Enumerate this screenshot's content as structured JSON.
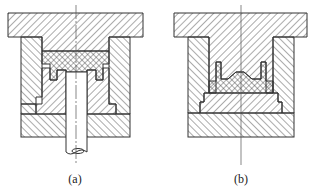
{
  "figure": {
    "type": "mold cross-section diagram",
    "panels": [
      {
        "id": "a",
        "label": "(a)",
        "description": "Mold with lower plunger rod pushing material upward into upper cavity"
      },
      {
        "id": "b",
        "label": "(b)",
        "description": "Mold with compacted material on lower punch, no plunger rod"
      }
    ],
    "colors": {
      "line": "#333333",
      "hatch": "#555555",
      "background": "#ffffff"
    },
    "hatch_patterns": [
      "diagonal-right",
      "diagonal-left",
      "crosshatch"
    ]
  }
}
